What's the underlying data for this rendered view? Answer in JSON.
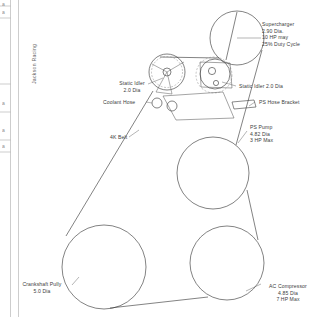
{
  "drawing": {
    "title_block": {
      "vertical_label": "Jackson Racing"
    },
    "edge_fragments": [
      "a",
      "a",
      "a",
      "a",
      "a",
      "a"
    ],
    "components": [
      {
        "id": "supercharger",
        "name": "Supercharger",
        "label_lines": [
          "Supercharger",
          "2.90 Dia.",
          "10 HP may",
          "25% Duty Cycle"
        ],
        "diameter": "2.90 Dia.",
        "power": "10 HP may",
        "duty": "25% Duty Cycle",
        "cx": 237,
        "cy": 38,
        "r": 27,
        "label_x": 262,
        "label_y": 22
      },
      {
        "id": "static-idler-left",
        "name": "Static Idler",
        "label_lines": [
          "Static Idler",
          "2.0 Dia"
        ],
        "diameter": "2.0 Dia",
        "cx": 167,
        "cy": 72,
        "r": 18,
        "label_x": 115,
        "label_y": 82
      },
      {
        "id": "static-idler-right",
        "name": "Static Idler",
        "label_lines": [
          "Static Idler  2.0 Dia"
        ],
        "diameter": "2.0 Dia",
        "cx": 214,
        "cy": 75,
        "r": 18,
        "label_x": 238,
        "label_y": 86
      },
      {
        "id": "coolant-hose",
        "name": "Coolant Hose",
        "label_lines": [
          "Coolant Hose"
        ],
        "cx": 157,
        "cy": 103,
        "r": 5,
        "label_x": 103,
        "label_y": 100
      },
      {
        "id": "ps-hose-bracket",
        "name": "PS Hose Bracket",
        "label_lines": [
          "PS Hose Bracket"
        ],
        "label_x": 257,
        "label_y": 100
      },
      {
        "id": "ps-pump",
        "name": "PS Pump",
        "label_lines": [
          "PS Pump",
          "4.82 Dia",
          "3 HP Max"
        ],
        "diameter": "4.82 Dia",
        "power": "3 HP Max",
        "cx": 213,
        "cy": 173,
        "r": 36,
        "label_x": 249,
        "label_y": 125
      },
      {
        "id": "4k-belt",
        "name": "4K Belt",
        "label_lines": [
          "4K Belt"
        ],
        "label_x": 110,
        "label_y": 138
      },
      {
        "id": "crankshaft-pulley",
        "name": "Crankshaft Pully",
        "label_lines": [
          "Crankshaft Pully",
          "5.0 Dia"
        ],
        "diameter": "5.0 Dia",
        "cx": 104,
        "cy": 267,
        "r": 42,
        "label_x": 41,
        "label_y": 283
      },
      {
        "id": "ac-compressor",
        "name": "AC Compressor",
        "label_lines": [
          "AC Compressor",
          "4.85 Dia",
          "7 HP Max"
        ],
        "diameter": "4.85 Dia",
        "power": "7 HP Max",
        "cx": 227,
        "cy": 263,
        "r": 37,
        "label_x": 263,
        "label_y": 285
      }
    ]
  }
}
